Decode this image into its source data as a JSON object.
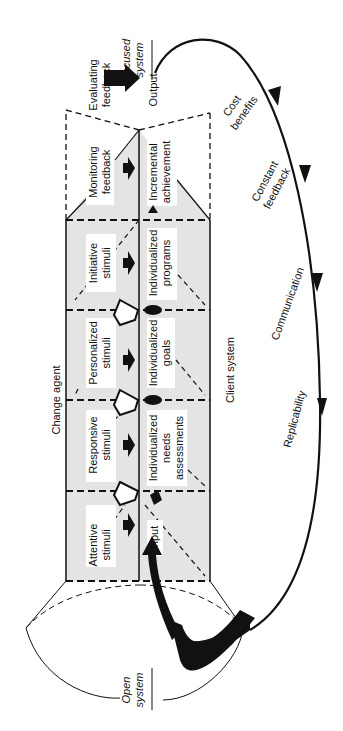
{
  "diagram": {
    "orientation": "rotated-90-ccw",
    "top_heading": "Change agent",
    "bottom_heading": "Client system",
    "stages": [
      {
        "agent": [
          "Attentive",
          "stimuli"
        ],
        "client": [
          "Input"
        ]
      },
      {
        "agent": [
          "Responsive",
          "stimuli"
        ],
        "client": [
          "Individualized",
          "needs",
          "assessments"
        ]
      },
      {
        "agent": [
          "Personalized",
          "stimuli"
        ],
        "client": [
          "Individualized",
          "goals"
        ]
      },
      {
        "agent": [
          "Initiative",
          "stimuli"
        ],
        "client": [
          "Individualized",
          "programs"
        ]
      },
      {
        "agent": [
          "Monitoring",
          "feedback"
        ],
        "client": [
          "Incremental",
          "achievement"
        ]
      }
    ],
    "output_label": "Output",
    "evaluating_label": [
      "Evaluating",
      "feedback"
    ],
    "focused_system": [
      "Focused",
      "system"
    ],
    "open_system": [
      "Open",
      "system"
    ],
    "loop_labels": [
      [
        "Cost",
        "benefits"
      ],
      [
        "Constant",
        "feedback"
      ],
      [
        "Communication"
      ],
      [
        "Replicability"
      ]
    ],
    "colors": {
      "ink": "#111111",
      "shade": "#e4e4e4",
      "label_bg": "#ffffff"
    }
  }
}
